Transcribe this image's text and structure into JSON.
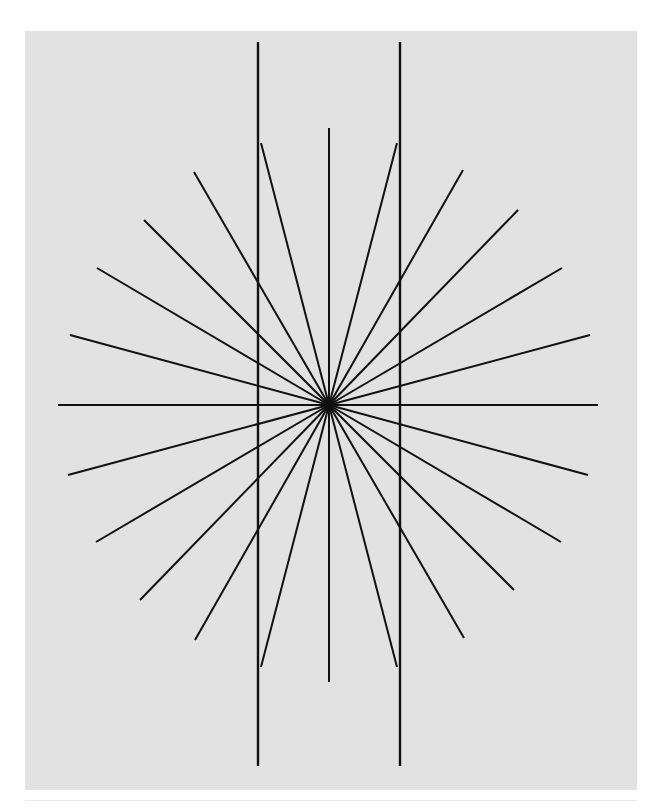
{
  "figure": {
    "kind": "line-drawing",
    "canvas": {
      "image_width": 663,
      "image_height": 812,
      "panel_x": 25,
      "panel_y": 31,
      "panel_width": 612,
      "panel_height": 759,
      "background_color": "#e2e2e2",
      "page_color": "#ffffff",
      "rule_color": "#e8e8e8"
    },
    "center": {
      "x": 304,
      "y": 374
    },
    "stroke": {
      "color": "#111111",
      "width": 2.0,
      "width_thin": 1.6
    },
    "ray_count": 24,
    "angle_step_degrees": 15,
    "lines": [
      {
        "name": "horizontal-axis",
        "x1": 33,
        "y1": 374,
        "x2": 573,
        "y2": 374,
        "width": 2.0
      },
      {
        "name": "vertical-center-axis",
        "x1": 304,
        "y1": 97,
        "x2": 304,
        "y2": 651,
        "width": 2.0
      },
      {
        "name": "tall-vertical-left",
        "x1": 233,
        "y1": 11,
        "x2": 233,
        "y2": 735,
        "width": 2.4
      },
      {
        "name": "tall-vertical-right",
        "x1": 375,
        "y1": 11,
        "x2": 375,
        "y2": 735,
        "width": 2.4
      },
      {
        "name": "ray-steep-upleft-inner",
        "x1": 304,
        "y1": 374,
        "x2": 236,
        "y2": 112,
        "width": 2.0
      },
      {
        "name": "ray-steep-upright-inner",
        "x1": 304,
        "y1": 374,
        "x2": 372,
        "y2": 112,
        "width": 2.0
      },
      {
        "name": "ray-steep-downleft-inner",
        "x1": 304,
        "y1": 374,
        "x2": 236,
        "y2": 636,
        "width": 2.0
      },
      {
        "name": "ray-steep-downright-inner",
        "x1": 304,
        "y1": 374,
        "x2": 372,
        "y2": 636,
        "width": 2.0
      },
      {
        "name": "ray-upleft-60",
        "x1": 304,
        "y1": 374,
        "x2": 169,
        "y2": 141,
        "width": 2.0
      },
      {
        "name": "ray-downright-60",
        "x1": 304,
        "y1": 374,
        "x2": 439,
        "y2": 607,
        "width": 2.0
      },
      {
        "name": "ray-upleft-45",
        "x1": 304,
        "y1": 374,
        "x2": 119,
        "y2": 189,
        "width": 2.0
      },
      {
        "name": "ray-downright-45",
        "x1": 304,
        "y1": 374,
        "x2": 489,
        "y2": 559,
        "width": 2.0
      },
      {
        "name": "ray-upleft-30",
        "x1": 304,
        "y1": 374,
        "x2": 72,
        "y2": 237,
        "width": 2.0
      },
      {
        "name": "ray-downright-30",
        "x1": 304,
        "y1": 374,
        "x2": 536,
        "y2": 511,
        "width": 2.0
      },
      {
        "name": "ray-upleft-15",
        "x1": 304,
        "y1": 374,
        "x2": 45,
        "y2": 304,
        "width": 2.0
      },
      {
        "name": "ray-downright-15",
        "x1": 304,
        "y1": 374,
        "x2": 563,
        "y2": 444,
        "width": 2.0
      },
      {
        "name": "ray-upright-75",
        "x1": 304,
        "y1": 374,
        "x2": 438,
        "y2": 139,
        "width": 2.0
      },
      {
        "name": "ray-downleft-75",
        "x1": 304,
        "y1": 374,
        "x2": 170,
        "y2": 609,
        "width": 2.0
      },
      {
        "name": "ray-upright-60",
        "x1": 304,
        "y1": 374,
        "x2": 493,
        "y2": 179,
        "width": 2.0
      },
      {
        "name": "ray-downleft-60",
        "x1": 304,
        "y1": 374,
        "x2": 115,
        "y2": 569,
        "width": 2.0
      },
      {
        "name": "ray-upright-45",
        "x1": 304,
        "y1": 374,
        "x2": 537,
        "y2": 237,
        "width": 2.0
      },
      {
        "name": "ray-downleft-45",
        "x1": 304,
        "y1": 374,
        "x2": 71,
        "y2": 511,
        "width": 2.0
      },
      {
        "name": "ray-upright-30",
        "x1": 304,
        "y1": 374,
        "x2": 565,
        "y2": 304,
        "width": 2.0
      },
      {
        "name": "ray-downleft-30",
        "x1": 304,
        "y1": 374,
        "x2": 43,
        "y2": 444,
        "width": 2.0
      }
    ]
  },
  "caption": {
    "text": ""
  }
}
